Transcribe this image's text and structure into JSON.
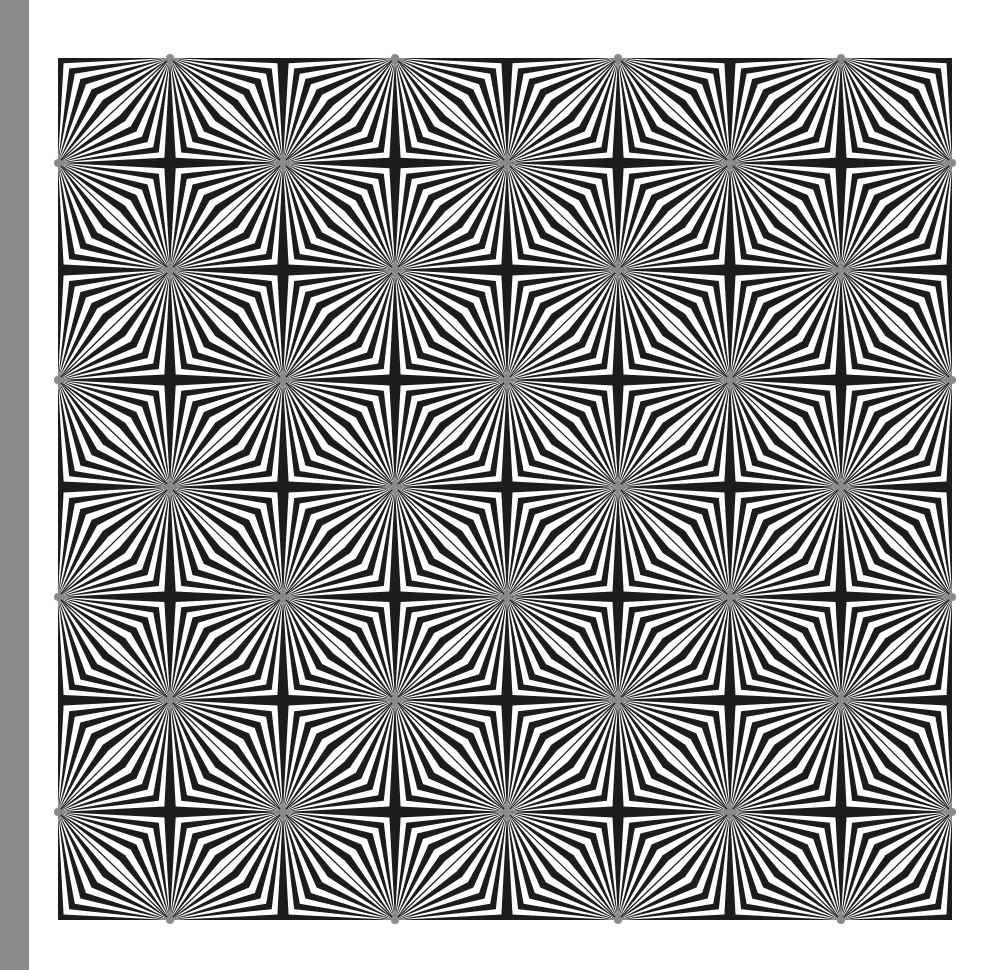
{
  "artwork": {
    "title": "Op-art starburst tessellation",
    "background_color": "#ffffff",
    "ink_color": "#1c1c1c",
    "side_strip_color": "#8b8b8b",
    "grid": {
      "x_vertices": [
        58,
        170,
        283,
        395,
        507,
        618,
        730,
        841,
        952
      ],
      "y_vertices": [
        58,
        163,
        270,
        380,
        487,
        597,
        700,
        812,
        920
      ],
      "star_rule": "vertex (i,j) is a starburst when i+j is odd; a cross junction when i+j is even",
      "tiles_across": 4,
      "tiles_down": 4,
      "bands_per_lens": 10
    }
  }
}
